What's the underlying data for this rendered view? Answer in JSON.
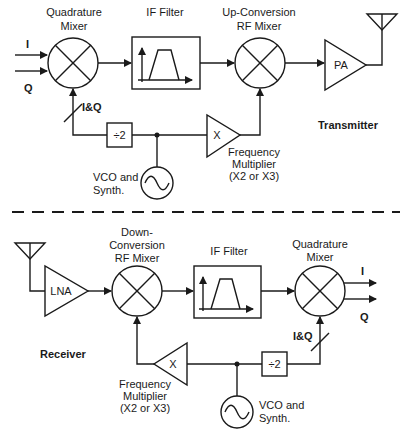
{
  "transmitter": {
    "section_label": "Transmitter",
    "inputs": {
      "i": "I",
      "q": "Q"
    },
    "quadrature_mixer": {
      "label_line1": "Quadrature",
      "label_line2": "Mixer"
    },
    "if_filter": {
      "label": "IF Filter"
    },
    "upconversion_mixer": {
      "label_line1": "Up-Conversion",
      "label_line2": "RF Mixer"
    },
    "pa": {
      "label": "PA"
    },
    "iq_bus": {
      "label": "I&Q"
    },
    "divider": {
      "label": "÷2"
    },
    "vco": {
      "label_line1": "VCO and",
      "label_line2": "Synth."
    },
    "multiplier": {
      "symbol": "X",
      "label_line1": "Frequency",
      "label_line2": "Multiplier",
      "label_line3": "(X2 or X3)"
    }
  },
  "receiver": {
    "section_label": "Receiver",
    "lna": {
      "label": "LNA"
    },
    "downconversion_mixer": {
      "label_line1": "Down-",
      "label_line2": "Conversion",
      "label_line3": "RF Mixer"
    },
    "if_filter": {
      "label": "IF Filter"
    },
    "quadrature_mixer": {
      "label_line1": "Quadrature",
      "label_line2": "Mixer"
    },
    "outputs": {
      "i": "I",
      "q": "Q"
    },
    "iq_bus": {
      "label": "I&Q"
    },
    "divider": {
      "label": "÷2"
    },
    "vco": {
      "label_line1": "VCO and",
      "label_line2": "Synth."
    },
    "multiplier": {
      "symbol": "X",
      "label_line1": "Frequency",
      "label_line2": "Multiplier",
      "label_line3": "(X2 or X3)"
    }
  },
  "colors": {
    "stroke": "#1a1a1a",
    "background": "#ffffff"
  }
}
